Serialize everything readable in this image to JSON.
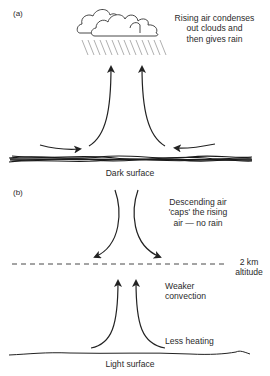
{
  "panel_a": {
    "label": "(a)",
    "cloud_caption": "Rising air condenses\nout clouds and\nthen gives rain",
    "surface_label": "Dark surface"
  },
  "panel_b": {
    "label": "(b)",
    "descending_caption": "Descending air\n'caps' the rising\nair — no rain",
    "altitude_label": "2 km\naltitude",
    "convection_label": "Weaker\nconvection",
    "heating_label": "Less heating",
    "surface_label": "Light surface"
  },
  "colors": {
    "ink": "#222222",
    "rain": "#9a9a9a",
    "text": "#2a2a2a"
  }
}
